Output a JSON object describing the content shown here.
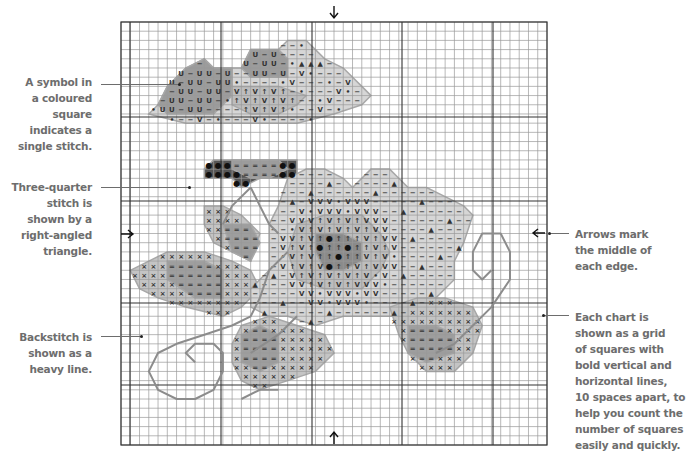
{
  "chart": {
    "grid": {
      "left": 121,
      "top": 22,
      "right": 547,
      "bottom": 445,
      "cols": 46,
      "rows": 46,
      "bold_x": [
        130,
        221,
        312,
        402,
        493
      ],
      "bold_y": [
        117,
        201,
        303,
        385
      ],
      "line_color": "#9a9a9a",
      "bold_color": "#333333"
    },
    "center_arrows": {
      "top": {
        "x": 334,
        "y": 6,
        "glyph": "down-arrow"
      },
      "bottom": {
        "x": 334,
        "y": 432,
        "glyph": "up-arrow"
      },
      "left": {
        "x": 121,
        "y": 234,
        "glyph": "right-arrow"
      },
      "right": {
        "x": 533,
        "y": 233,
        "glyph": "left-arrow"
      }
    },
    "colors": {
      "petal_light": "#d6d6d6",
      "petal_mid": "#bdbdbd",
      "petal_dark": "#9c9c9c",
      "centre_dark": "#8a8a8a",
      "leaf_light": "#c4c4c4",
      "leaf_dark": "#9e9e9e",
      "bud_dark": "#555555",
      "outline": "#a8a8a8",
      "backstitch": "#8c8c8c"
    },
    "symbols": {
      "dash": "−",
      "u": "U",
      "v": "V",
      "dot": "•",
      "arrow_up": "↑",
      "triangle": "▲",
      "cross": "×",
      "equals": "=",
      "bullet": "●"
    }
  },
  "annotations": {
    "single_stitch": {
      "lines": [
        "A symbol in",
        "a coloured",
        "square",
        "indicates a",
        "single stitch."
      ]
    },
    "three_quarter": {
      "lines": [
        "Three-quarter",
        "stitch is",
        "shown by a",
        "right-angled",
        "triangle."
      ]
    },
    "backstitch": {
      "lines": [
        "Backstitch is",
        "shown as a",
        "heavy line."
      ]
    },
    "arrows": {
      "lines": [
        "Arrows mark",
        "the middle of",
        "each edge."
      ]
    },
    "grid_note": {
      "lines": [
        "Each chart is",
        "shown as a grid",
        "of squares with",
        "bold vertical and",
        "horizontal lines,",
        "10 spaces apart, to",
        "help you count the",
        "number of squares",
        "easily and quickly."
      ]
    }
  }
}
